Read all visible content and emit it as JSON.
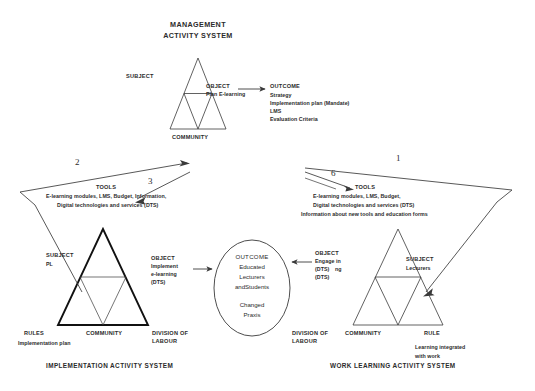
{
  "diagram": {
    "management": {
      "heading_line1": "MANAGEMENT",
      "heading_line2": "ACTIVITY SYSTEM",
      "subject": "SUBJECT",
      "community": "COMMUNITY",
      "object_label": "OBJECT",
      "object_text": "Plan E-learning",
      "outcome_label": "OUTCOME",
      "outcome_items": [
        "Strategy",
        "Implementation plan (Mandate)",
        "LMS",
        "Evaluation Criteria"
      ]
    },
    "implementation": {
      "system_title": "IMPLEMENTATION ACTIVITY SYSTEM",
      "tools_label": "TOOLS",
      "tools_line1": "E-learning modules, LMS,  Budget, Information,",
      "tools_line2": "Digital technologies and services (DTS)",
      "subject_label": "SUBJECT",
      "subject_value": "PL",
      "community": "COMMUNITY",
      "rules_label": "RULES",
      "rules_value": "Implementation plan",
      "division_line1": "DIVISION OF",
      "division_line2": "LABOUR",
      "object_label": "OBJECT",
      "object_line1": "Implement",
      "object_line2": "e-learning",
      "object_line3": "(DTS)"
    },
    "worklearning": {
      "system_title": "WORK LEARNING ACTIVITY SYSTEM",
      "tools_label": "TOOLS",
      "tools_line1": "E-learning modules, LMS,  Budget,",
      "tools_line2": "Digital technologies and services (DTS)",
      "tools_line3": "Information about new tools and education forms",
      "subject_label": "SUBJECT",
      "subject_value": "Lecturers",
      "community": "COMMUNITY",
      "rules_label": "RULE",
      "rules_value_line1": "Learning integrated",
      "rules_value_line2": "with work",
      "division_line1": "DIVISION OF",
      "division_line2": "LABOUR",
      "object_label": "OBJECT",
      "object_line1": "Engage in",
      "object_line2": "(DTS)",
      "object_line3": "(DTS)",
      "object_line2b": "ng"
    },
    "shared_outcome": {
      "label": "OUTCOME",
      "line1": "Educated",
      "line2": "Lecturers",
      "line3": "andStudents",
      "line4": "Changed",
      "line5": "Praxis"
    },
    "arrow_numbers": {
      "n1": "1",
      "n2": "2",
      "n3": "3",
      "n6": "6"
    },
    "colors": {
      "ink": "#2b2b2b",
      "line": "#3a3a3a",
      "bold_line": "#111111",
      "background": "#ffffff"
    }
  }
}
